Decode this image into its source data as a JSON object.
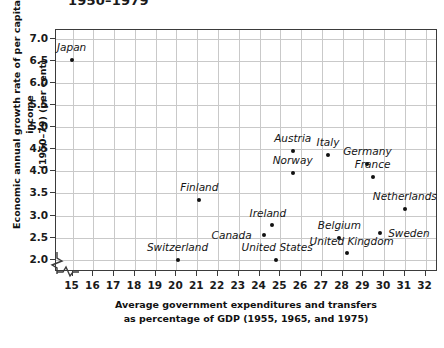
{
  "chart_data": {
    "type": "scatter",
    "title": "1950–1979",
    "xlabel": "Average government expenditures and transfers as percentage of GDP (1955, 1965, and 1975)",
    "xlabel_line1": "Average government expenditures and transfers",
    "xlabel_line2": "as percentage of GDP (1955, 1965, and 1975)",
    "ylabel": "Economic annual growth rate of per capita income (1950–79) (per cent)",
    "ylabel_line1": "Economic annual growth rate of per capita income",
    "ylabel_line2": "(1950–79) (per cent)",
    "xlim": [
      14.2,
      32.6
    ],
    "ylim": [
      1.72,
      7.2
    ],
    "xticks": [
      15,
      16,
      17,
      18,
      19,
      20,
      21,
      22,
      23,
      24,
      25,
      26,
      27,
      28,
      29,
      30,
      31,
      32
    ],
    "yticks": [
      2.0,
      2.5,
      3.0,
      3.5,
      4.0,
      4.5,
      5.0,
      5.5,
      6.0,
      6.5,
      7.0
    ],
    "xtick_labels": [
      "15",
      "16",
      "17",
      "18",
      "19",
      "20",
      "21",
      "22",
      "23",
      "24",
      "25",
      "26",
      "27",
      "28",
      "29",
      "30",
      "31",
      "32"
    ],
    "ytick_labels": [
      "2.0",
      "2.5",
      "3.0",
      "3.5",
      "4.0",
      "4.5",
      "5.0",
      "5.5",
      "6.0",
      "6.5",
      "7.0"
    ],
    "grid": true,
    "legend": "none",
    "axis_break_x": true,
    "axis_break_y": true,
    "marker_color": "#111111",
    "grid_color": "#c9c9c9",
    "frame_color": "#3b3b3b",
    "points": [
      {
        "name": "Japan",
        "x": 14.95,
        "y": 6.52,
        "label_dx": 0,
        "label_dy": -13
      },
      {
        "name": "Switzerland",
        "x": 20.05,
        "y": 2.0,
        "label_dx": 0,
        "label_dy": -13
      },
      {
        "name": "Finland",
        "x": 21.1,
        "y": 3.35,
        "label_dx": 0,
        "label_dy": -13
      },
      {
        "name": "Canada",
        "x": 24.2,
        "y": 2.55,
        "label_dx": -32,
        "label_dy": 0
      },
      {
        "name": "Ireland",
        "x": 24.6,
        "y": 2.78,
        "label_dx": -4,
        "label_dy": -12
      },
      {
        "name": "United States",
        "x": 24.8,
        "y": 1.99,
        "label_dx": 1,
        "label_dy": -13
      },
      {
        "name": "Austria",
        "x": 25.6,
        "y": 4.46,
        "label_dx": 0,
        "label_dy": -13
      },
      {
        "name": "Norway",
        "x": 25.6,
        "y": 3.96,
        "label_dx": 0,
        "label_dy": -13
      },
      {
        "name": "Italy",
        "x": 27.3,
        "y": 4.36,
        "label_dx": 0,
        "label_dy": -13
      },
      {
        "name": "Belgium",
        "x": 27.85,
        "y": 2.5,
        "label_dx": 0,
        "label_dy": -13
      },
      {
        "name": "United Kingdom",
        "x": 28.2,
        "y": 2.16,
        "label_dx": 5,
        "label_dy": -12
      },
      {
        "name": "Germany",
        "x": 29.2,
        "y": 4.17,
        "label_dx": 0,
        "label_dy": -13
      },
      {
        "name": "France",
        "x": 29.45,
        "y": 3.87,
        "label_dx": 0,
        "label_dy": -13
      },
      {
        "name": "Sweden",
        "x": 29.8,
        "y": 2.6,
        "label_dx": 29,
        "label_dy": 0
      },
      {
        "name": "Netherlands",
        "x": 31.0,
        "y": 3.15,
        "label_dx": 0,
        "label_dy": -13
      }
    ]
  }
}
